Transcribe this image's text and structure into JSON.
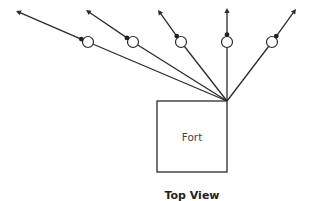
{
  "fort": {
    "label": "Fort"
  },
  "caption": "Top View",
  "rays": [
    {
      "name": "ray-1",
      "direction": "far-left"
    },
    {
      "name": "ray-2",
      "direction": "left"
    },
    {
      "name": "ray-3",
      "direction": "up-left"
    },
    {
      "name": "ray-4",
      "direction": "up"
    },
    {
      "name": "ray-5",
      "direction": "up-right"
    }
  ],
  "colors": {
    "line": "#2b2b2b",
    "text": "#444444",
    "background": "#ffffff"
  }
}
